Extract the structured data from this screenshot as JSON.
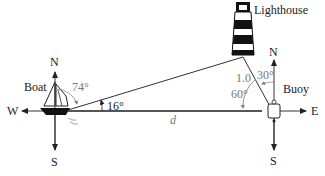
{
  "diagram": {
    "labels": {
      "boat": "Boat",
      "lighthouse": "Lighthouse",
      "buoy": "Buoy",
      "distance": "d"
    },
    "compass_boat": {
      "north": "N",
      "south": "S",
      "west": "W"
    },
    "compass_buoy": {
      "north": "N",
      "south": "S",
      "east": "E"
    },
    "angles": {
      "boat_from_north": "74°",
      "boat_above_horizontal": "16°",
      "buoy_from_north": "30°",
      "buoy_from_horizontal": "60°"
    },
    "lengths": {
      "buoy_to_lighthouse": "1.0"
    },
    "colors": {
      "line": "#333333",
      "annotation": "#777777",
      "axis": "#555555"
    }
  }
}
